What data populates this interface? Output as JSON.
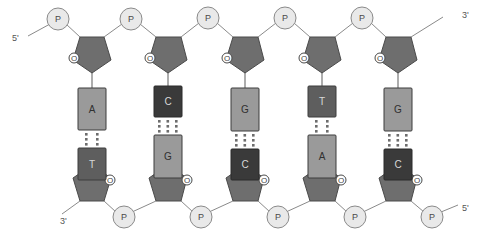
{
  "diagram": {
    "type": "dna-structure",
    "colors": {
      "background": "#ffffff",
      "phosphate_fill": "#e9e9e9",
      "phosphate_stroke": "#8a8a8a",
      "sugar_fill": "#6e6e6e",
      "sugar_stroke": "#4a4a4a",
      "base_light_fill": "#9a9a9a",
      "base_dark_fill": "#3a3a3a",
      "base_stroke": "#3c3c3c",
      "bond_line": "#7d7d7d",
      "hbond_dot": "#6d6d6d",
      "label_text": "#555555"
    },
    "labels": {
      "phosphate": "P",
      "oxygen": "O",
      "top_left_end": "5'",
      "top_right_end": "3'",
      "bottom_left_end": "3'",
      "bottom_right_end": "5'"
    },
    "strands": {
      "top": {
        "name": "top-strand",
        "direction": "5' to 3'",
        "sequence": [
          "A",
          "C",
          "G",
          "T",
          "G"
        ]
      },
      "bottom": {
        "name": "bottom-strand",
        "direction": "3' to 5'",
        "sequence": [
          "T",
          "G",
          "C",
          "A",
          "C"
        ]
      }
    },
    "base_pairs": [
      {
        "index": 1,
        "top": "A",
        "bottom": "T",
        "top_shade": "light",
        "bottom_shade": "dark",
        "hydrogen_bonds": 2,
        "x": 92
      },
      {
        "index": 2,
        "top": "C",
        "bottom": "G",
        "top_shade": "dark",
        "bottom_shade": "light",
        "hydrogen_bonds": 3,
        "x": 168
      },
      {
        "index": 3,
        "top": "G",
        "bottom": "C",
        "top_shade": "light",
        "bottom_shade": "dark",
        "hydrogen_bonds": 3,
        "x": 245
      },
      {
        "index": 4,
        "top": "T",
        "bottom": "A",
        "top_shade": "dark",
        "bottom_shade": "light",
        "hydrogen_bonds": 2,
        "x": 322
      },
      {
        "index": 5,
        "top": "G",
        "bottom": "C",
        "top_shade": "light",
        "bottom_shade": "dark",
        "hydrogen_bonds": 3,
        "x": 398
      }
    ],
    "top_phosphates": [
      {
        "name": "phosphate-top-1",
        "x": 58,
        "y": 19
      },
      {
        "name": "phosphate-top-2",
        "x": 131,
        "y": 19
      },
      {
        "name": "phosphate-top-3",
        "x": 208,
        "y": 18
      },
      {
        "name": "phosphate-top-4",
        "x": 285,
        "y": 18
      },
      {
        "name": "phosphate-top-5",
        "x": 362,
        "y": 18
      }
    ],
    "bottom_phosphates": [
      {
        "name": "phosphate-bottom-1",
        "x": 124,
        "y": 217
      },
      {
        "name": "phosphate-bottom-2",
        "x": 201,
        "y": 217
      },
      {
        "name": "phosphate-bottom-3",
        "x": 278,
        "y": 217
      },
      {
        "name": "phosphate-bottom-4",
        "x": 355,
        "y": 217
      },
      {
        "name": "phosphate-bottom-5",
        "x": 432,
        "y": 217
      }
    ],
    "top_sugars": [
      {
        "name": "sugar-top-1",
        "x": 92,
        "y": 48
      },
      {
        "name": "sugar-top-2",
        "x": 168,
        "y": 48
      },
      {
        "name": "sugar-top-3",
        "x": 245,
        "y": 48
      },
      {
        "name": "sugar-top-4",
        "x": 322,
        "y": 48
      },
      {
        "name": "sugar-top-5",
        "x": 398,
        "y": 48
      }
    ],
    "bottom_sugars": [
      {
        "name": "sugar-bottom-1",
        "x": 92,
        "y": 190
      },
      {
        "name": "sugar-bottom-2",
        "x": 168,
        "y": 190
      },
      {
        "name": "sugar-bottom-3",
        "x": 245,
        "y": 190
      },
      {
        "name": "sugar-bottom-4",
        "x": 322,
        "y": 190
      },
      {
        "name": "sugar-bottom-5",
        "x": 398,
        "y": 190
      }
    ]
  }
}
